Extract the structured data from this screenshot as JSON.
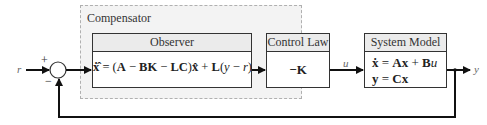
{
  "diagram": {
    "type": "block-diagram",
    "compensator": {
      "label": "Compensator"
    },
    "blocks": {
      "observer": {
        "title": "Observer",
        "equation_parts": [
          "ẋ̂",
          " = (",
          "A",
          " − ",
          "BK",
          " − ",
          "LC",
          ")",
          "x̂",
          " + ",
          "L",
          "(",
          "y",
          " − ",
          "r",
          ")"
        ]
      },
      "control_law": {
        "title": "Control Law",
        "equation": "−K"
      },
      "system_model": {
        "title": "System Model",
        "eq1_parts": [
          "ẋ",
          " = ",
          "Ax",
          " + ",
          "B",
          "u"
        ],
        "eq2_parts": [
          "y",
          " = ",
          "Cx"
        ]
      }
    },
    "signals": {
      "input": "r",
      "control": "u",
      "output": "y"
    },
    "summing_junction": {
      "plus": "+",
      "minus": "−"
    },
    "colors": {
      "line": "#111111",
      "compensator_bg": "#f3f3f3",
      "compensator_border": "#b0b0b0",
      "header_bg": "#ebebeb"
    }
  }
}
